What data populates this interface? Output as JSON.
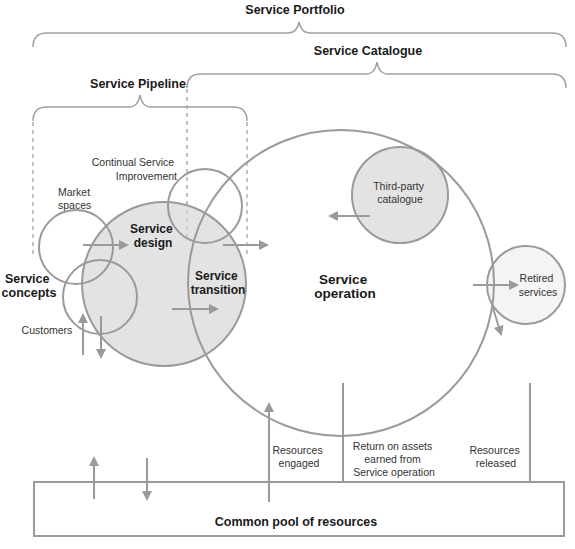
{
  "brackets": {
    "portfolio": "Service Portfolio",
    "catalogue": "Service Catalogue",
    "pipeline": "Service Pipeline"
  },
  "nodes": {
    "continual_service_improvement": [
      "Continual Service",
      "Improvement"
    ],
    "market_spaces": [
      "Market",
      "spaces"
    ],
    "service_design": [
      "Service",
      "design"
    ],
    "service_concepts": [
      "Service",
      "concepts"
    ],
    "customers": "Customers",
    "service_transition": [
      "Service",
      "transition"
    ],
    "service_operation": [
      "Service",
      "operation"
    ],
    "third_party_catalogue": [
      "Third-party",
      "catalogue"
    ],
    "retired_services": [
      "Retired",
      "services"
    ]
  },
  "flows": {
    "resources_engaged": [
      "Resources",
      "engaged"
    ],
    "return_on_assets": [
      "Return on assets",
      "earned from",
      "Service operation"
    ],
    "resources_released": [
      "Resources",
      "released"
    ]
  },
  "pool": {
    "label": "Common pool of resources"
  },
  "colors": {
    "stroke": "#9a9a9a",
    "circle_fill": "#e3e3e3",
    "retired_fill": "#f4f4f4",
    "text": "#1a1a1a"
  }
}
